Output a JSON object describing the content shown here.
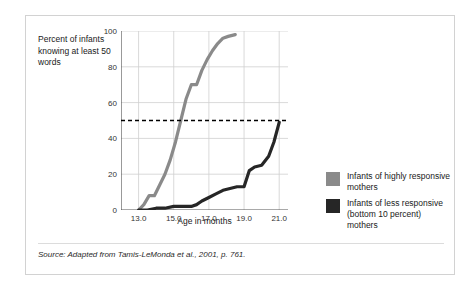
{
  "figure": {
    "y_axis_title": "Percent of infants knowing at least 50 words",
    "x_axis_title": "Age in months",
    "source_note": "Source: Adapted from Tamis-LeMonda et al., 2001, p. 761."
  },
  "legend": {
    "position": "right",
    "items": [
      {
        "label": "Infants of highly responsive mothers",
        "color": "#8a8a8a",
        "swatch_name": "legend-swatch-highly-responsive"
      },
      {
        "label": "Infants of less responsive (bottom 10 percent) mothers",
        "color": "#262626",
        "swatch_name": "legend-swatch-less-responsive"
      }
    ]
  },
  "colors": {
    "series_highly_responsive": "#8a8a8a",
    "series_less_responsive": "#262626",
    "gridline": "#cfcfcf",
    "axis": "#555555",
    "reference_line": "#000000",
    "card_border": "#d2d2d2",
    "background": "#ffffff"
  },
  "chart_data": {
    "type": "line",
    "title": "",
    "subtitle": "",
    "xlabel": "Age in months",
    "ylabel": "Percent of infants knowing at least 50 words",
    "xlim": [
      12.0,
      21.5
    ],
    "ylim": [
      0,
      100
    ],
    "xticks": [
      13.0,
      15.0,
      17.0,
      19.0,
      21.0
    ],
    "xtick_labels": [
      "13.0",
      "15.0",
      "17.0",
      "19.0",
      "21.0"
    ],
    "yticks": [
      0,
      20,
      40,
      60,
      80,
      100
    ],
    "ytick_labels": [
      "0",
      "20",
      "40",
      "60",
      "80",
      "100"
    ],
    "grid": true,
    "grid_axis": "both",
    "legend_position": "right",
    "annotations": [
      {
        "type": "hline",
        "name": "fifty-percent-reference-line",
        "y": 50,
        "style": "dashed",
        "color": "#000000",
        "label": ""
      }
    ],
    "series": [
      {
        "name": "Infants of highly responsive mothers",
        "color": "#8a8a8a",
        "x": [
          13.0,
          13.3,
          13.6,
          13.9,
          14.2,
          14.5,
          14.8,
          15.1,
          15.4,
          15.7,
          16.0,
          16.3,
          16.6,
          16.9,
          17.2,
          17.5,
          17.8,
          18.1,
          18.5
        ],
        "values": [
          0,
          3,
          8,
          8,
          14,
          20,
          28,
          38,
          50,
          62,
          70,
          70,
          78,
          84,
          89,
          93,
          96,
          97,
          98
        ]
      },
      {
        "name": "Infants of less responsive (bottom 10 percent) mothers",
        "color": "#262626",
        "x": [
          13.0,
          13.5,
          14.0,
          14.5,
          15.0,
          15.5,
          16.0,
          16.3,
          16.6,
          17.0,
          17.4,
          17.8,
          18.2,
          18.6,
          19.0,
          19.3,
          19.6,
          20.0,
          20.4,
          20.7,
          21.0
        ],
        "values": [
          0,
          0,
          1,
          1,
          2,
          2,
          2,
          3,
          5,
          7,
          9,
          11,
          12,
          13,
          13,
          22,
          24,
          25,
          30,
          38,
          49
        ]
      }
    ]
  }
}
